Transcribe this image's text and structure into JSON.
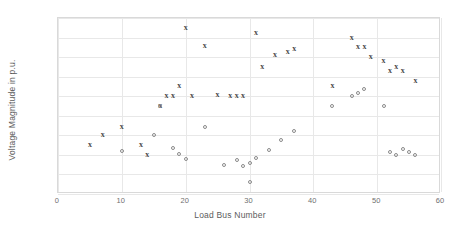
{
  "chart_data": {
    "type": "scatter",
    "title": "",
    "xlabel": "Load Bus Number",
    "ylabel": "Voltage Magnitude in p.u.",
    "xlim": [
      0,
      60
    ],
    "ylim": [
      0.92,
      1.1
    ],
    "xticks": [
      "0",
      "10",
      "20",
      "30",
      "40",
      "50",
      "60"
    ],
    "xtick_values": [
      0,
      10,
      20,
      30,
      40,
      50,
      60
    ],
    "yticks": [
      "0.92",
      "0.94",
      "0.96",
      "0.98",
      "1",
      "1.02",
      "1.04",
      "1.06",
      "1.08",
      "1.1"
    ],
    "ytick_values": [
      0.92,
      0.94,
      0.96,
      0.98,
      1.0,
      1.02,
      1.04,
      1.06,
      1.08,
      1.1
    ],
    "grid": true,
    "legend": "none",
    "series": [
      {
        "name": "series-x",
        "marker": "x",
        "color": "#4a4a4a",
        "points": [
          [
            5,
            0.97
          ],
          [
            7,
            0.98
          ],
          [
            10,
            0.989
          ],
          [
            13,
            0.97
          ],
          [
            14,
            0.96
          ],
          [
            16,
            1.01
          ],
          [
            17,
            1.02
          ],
          [
            18,
            1.02
          ],
          [
            19,
            1.03
          ],
          [
            20,
            1.09
          ],
          [
            21,
            1.02
          ],
          [
            23,
            1.071
          ],
          [
            25,
            1.021
          ],
          [
            27,
            1.02
          ],
          [
            28,
            1.02
          ],
          [
            29,
            1.02
          ],
          [
            31,
            1.085
          ],
          [
            32,
            1.05
          ],
          [
            34,
            1.062
          ],
          [
            36,
            1.065
          ],
          [
            37,
            1.068
          ],
          [
            43,
            1.03
          ],
          [
            46,
            1.08
          ],
          [
            47,
            1.07
          ],
          [
            48,
            1.07
          ],
          [
            49,
            1.06
          ],
          [
            51,
            1.056
          ],
          [
            52,
            1.046
          ],
          [
            53,
            1.05
          ],
          [
            54,
            1.046
          ],
          [
            56,
            1.036
          ]
        ]
      },
      {
        "name": "series-o",
        "marker": "circle",
        "color": "#8a8a8a",
        "points": [
          [
            10,
            0.964
          ],
          [
            15,
            0.98
          ],
          [
            16,
            1.01
          ],
          [
            18,
            0.967
          ],
          [
            19,
            0.961
          ],
          [
            20,
            0.956
          ],
          [
            23,
            0.989
          ],
          [
            26,
            0.95
          ],
          [
            28,
            0.955
          ],
          [
            29,
            0.949
          ],
          [
            30,
            0.952
          ],
          [
            30,
            0.932
          ],
          [
            31,
            0.957
          ],
          [
            33,
            0.965
          ],
          [
            35,
            0.975
          ],
          [
            37,
            0.984
          ],
          [
            43,
            1.01
          ],
          [
            46,
            1.02
          ],
          [
            47,
            1.023
          ],
          [
            48,
            1.027
          ],
          [
            51,
            1.01
          ],
          [
            52,
            0.963
          ],
          [
            53,
            0.96
          ],
          [
            54,
            0.966
          ],
          [
            55,
            0.963
          ],
          [
            56,
            0.96
          ]
        ]
      }
    ]
  }
}
